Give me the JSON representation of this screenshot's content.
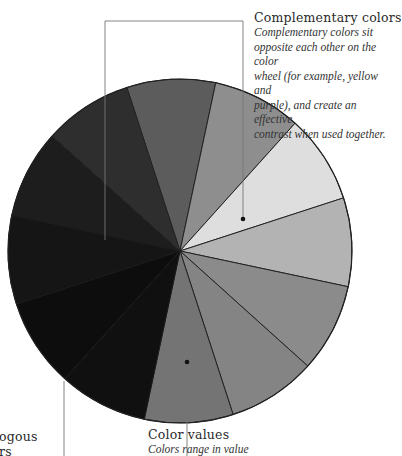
{
  "diagram": {
    "type": "color-value-wheel",
    "center": [
      180,
      251
    ],
    "radius": 172,
    "start_angle_deg": -108,
    "slice_count": 12,
    "slices": [
      {
        "index": 1,
        "color": "#5c5c5c"
      },
      {
        "index": 2,
        "color": "#8e8e8e"
      },
      {
        "index": 3,
        "color": "#dedede"
      },
      {
        "index": 4,
        "color": "#b3b3b3"
      },
      {
        "index": 5,
        "color": "#8b8b8b"
      },
      {
        "index": 6,
        "color": "#848484"
      },
      {
        "index": 7,
        "color": "#747474"
      },
      {
        "index": 8,
        "color": "#101010"
      },
      {
        "index": 9,
        "color": "#0d0d0d"
      },
      {
        "index": 10,
        "color": "#151515"
      },
      {
        "index": 11,
        "color": "#1d1d1d"
      },
      {
        "index": 12,
        "color": "#2e2e2e"
      }
    ],
    "outline_color": "#222222",
    "leader_color": "#777777"
  },
  "callouts": {
    "complementary": {
      "title": "Complementary colors",
      "body_lines": [
        "Complementary colors sit",
        "opposite each other on the color",
        "wheel (for example, yellow and",
        "purple), and create an effective",
        "contrast when used together."
      ]
    },
    "values": {
      "title": "Color values",
      "body_lines": [
        "Colors range in value"
      ]
    },
    "analogous": {
      "title_lines": [
        "ogous",
        "rs"
      ]
    }
  }
}
